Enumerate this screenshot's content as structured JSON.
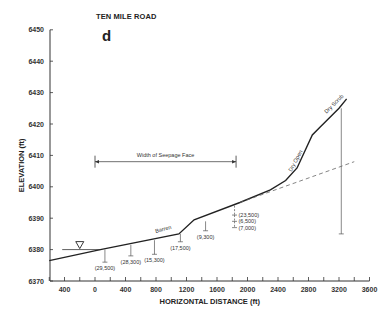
{
  "chart_data": {
    "type": "line",
    "title": "TEN MILE ROAD",
    "panel_label": "d",
    "xlabel": "HORIZONTAL DISTANCE (ft)",
    "ylabel": "ELEVATION (ft)",
    "xlim": [
      -600,
      3600
    ],
    "ylim": [
      6370,
      6450
    ],
    "x_ticks": [
      -400,
      0,
      400,
      800,
      1200,
      1600,
      2000,
      2400,
      2800,
      3200,
      3600
    ],
    "x_tick_labels": [
      "400",
      "0",
      "400",
      "800",
      "1200",
      "1600",
      "2000",
      "2400",
      "2800",
      "3200",
      "3600"
    ],
    "y_ticks": [
      6370,
      6380,
      6390,
      6400,
      6410,
      6420,
      6430,
      6440,
      6450
    ],
    "grid": false,
    "series": [
      {
        "name": "Ground surface",
        "style": "solid",
        "x": [
          -600,
          70,
          1100,
          1300,
          1900,
          2300,
          2500,
          2650,
          2850,
          2950,
          3200,
          3300
        ],
        "y": [
          6376.5,
          6380,
          6385,
          6389.5,
          6395,
          6399,
          6402,
          6406,
          6416.5,
          6419,
          6425,
          6428
        ]
      },
      {
        "name": "Water table (projected)",
        "style": "dashed",
        "x": [
          1900,
          3400
        ],
        "y": [
          6395,
          6408
        ]
      }
    ],
    "water_level_marker": {
      "x": -200,
      "y": 6380,
      "symbol": "▽"
    },
    "annotations": [
      {
        "text": "Width of Seepage Face",
        "x_start": 0,
        "x_end": 1850,
        "y": 6408
      },
      {
        "text": "Barren",
        "x": 900,
        "y": 6386
      },
      {
        "text": "Dry Open",
        "x": 2650,
        "y": 6408
      },
      {
        "text": "Dry Scrub",
        "x": 3150,
        "y": 6426
      }
    ],
    "piezometers": [
      {
        "x": 130,
        "top": 6380,
        "bottom": 6376,
        "label": "(29,500)"
      },
      {
        "x": 470,
        "top": 6381.5,
        "bottom": 6378,
        "label": "(28,300)"
      },
      {
        "x": 780,
        "top": 6383,
        "bottom": 6378.5,
        "label": "(15,300)"
      },
      {
        "x": 1120,
        "top": 6385,
        "bottom": 6382.5,
        "label": "(17,500)"
      },
      {
        "x": 1450,
        "top": 6389,
        "bottom": 6386,
        "label": "(9,300)"
      },
      {
        "x": 1830,
        "top": 6394,
        "bottom": 6391,
        "label": "(23,500)"
      },
      {
        "x": 1830,
        "top": 6391,
        "bottom": 6389,
        "label": "(6,500)"
      },
      {
        "x": 1830,
        "top": 6389,
        "bottom": 6387,
        "label": "(7,000)"
      },
      {
        "x": 3230,
        "top": 6425,
        "bottom": 6385,
        "label": ""
      }
    ]
  }
}
